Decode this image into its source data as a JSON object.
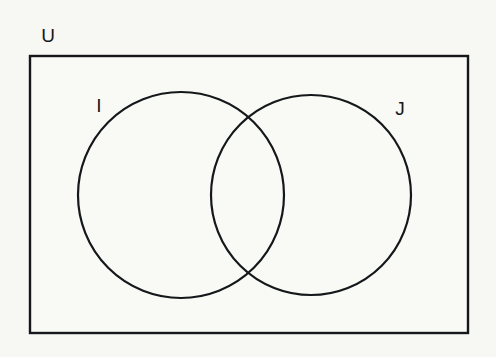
{
  "diagram": {
    "kind": "venn-diagram",
    "background_color": "#f7f8f4",
    "stroke_color": "#15181a",
    "fill_color": "#f9faf6",
    "canvas": {
      "width": 496,
      "height": 357
    },
    "universe": {
      "label": "U",
      "label_x": 48,
      "label_y": 37,
      "rect": {
        "x": 30,
        "y": 56,
        "width": 438,
        "height": 277
      },
      "stroke_width": 2.4
    },
    "sets": [
      {
        "id": "set-i",
        "label": "I",
        "cx": 181,
        "cy": 195,
        "r": 103,
        "label_x": 99,
        "label_y": 107,
        "stroke_width": 2.2
      },
      {
        "id": "set-j",
        "label": "J",
        "cx": 311,
        "cy": 195,
        "r": 100,
        "label_x": 400,
        "label_y": 110,
        "stroke_width": 2.2
      }
    ],
    "regions": {
      "intersection_label": "",
      "intersection_center_x": 246,
      "intersection_top_y": 120,
      "intersection_bottom_y": 270
    }
  }
}
